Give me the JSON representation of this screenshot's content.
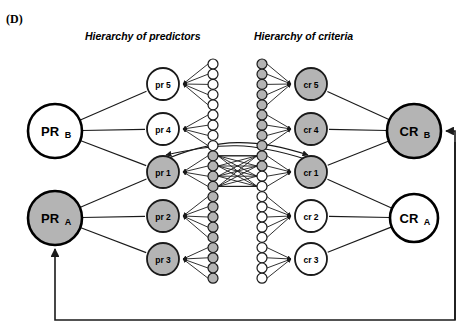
{
  "figure": {
    "panel_label": "(D)",
    "width": 471,
    "height": 336,
    "background": "#ffffff"
  },
  "colors": {
    "shaded": "#b4b4b4",
    "unshaded": "#ffffff",
    "stroke": "#1a1a1a",
    "text": "#000000"
  },
  "titles": {
    "predictors": "Hierarchy of predictors",
    "criteria": "Hierarchy of criteria"
  },
  "nodes": {
    "constructs": [
      {
        "id": "PR_B",
        "main": "PR",
        "sub": "B",
        "shaded": false,
        "cx": 55,
        "cy": 131,
        "r": 27
      },
      {
        "id": "PR_A",
        "main": "PR",
        "sub": "A",
        "shaded": true,
        "cx": 55,
        "cy": 218,
        "r": 27
      },
      {
        "id": "CR_B",
        "main": "CR",
        "sub": "B",
        "shaded": true,
        "cx": 414,
        "cy": 131,
        "r": 27
      },
      {
        "id": "CR_A",
        "main": "CR",
        "sub": "A",
        "shaded": false,
        "cx": 414,
        "cy": 218,
        "r": 24
      }
    ],
    "predictor_facets": [
      {
        "id": "pr5",
        "label": "pr 5",
        "shaded": false,
        "cx": 163,
        "cy": 84,
        "r": 16
      },
      {
        "id": "pr4",
        "label": "pr 4",
        "shaded": false,
        "cx": 163,
        "cy": 129,
        "r": 16
      },
      {
        "id": "pr1",
        "label": "pr 1",
        "shaded": true,
        "cx": 163,
        "cy": 172,
        "r": 16
      },
      {
        "id": "pr2",
        "label": "pr 2",
        "shaded": true,
        "cx": 163,
        "cy": 216,
        "r": 16
      },
      {
        "id": "pr3",
        "label": "pr 3",
        "shaded": true,
        "cx": 163,
        "cy": 259,
        "r": 16
      }
    ],
    "criteria_facets": [
      {
        "id": "cr5",
        "label": "cr 5",
        "shaded": true,
        "cx": 311,
        "cy": 84,
        "r": 16
      },
      {
        "id": "cr4",
        "label": "cr 4",
        "shaded": true,
        "cx": 311,
        "cy": 129,
        "r": 16
      },
      {
        "id": "cr1",
        "label": "cr 1",
        "shaded": true,
        "cx": 311,
        "cy": 172,
        "r": 16
      },
      {
        "id": "cr2",
        "label": "cr 2",
        "shaded": false,
        "cx": 311,
        "cy": 216,
        "r": 16
      },
      {
        "id": "cr3",
        "label": "cr 3",
        "shaded": false,
        "cx": 311,
        "cy": 259,
        "r": 16
      }
    ],
    "predictor_items": {
      "cx": 213,
      "top": 64,
      "count": 22,
      "spacing": 10.2,
      "r": 5.0,
      "shaded_from_index": 9
    },
    "criteria_items": {
      "cx": 262,
      "top": 64,
      "count": 22,
      "spacing": 10.2,
      "r": 5.0,
      "shaded_until_index": 11
    }
  },
  "feedback_loops": [
    {
      "id": "criteria-to-predictor-feedback",
      "from": "CR_A-region",
      "to": "PR_A",
      "description": "bottom loop returning to PR A"
    },
    {
      "id": "predictor-to-criteria-feedback",
      "from": "bottom-right",
      "to": "CR_B",
      "description": "right loop returning to CR B"
    }
  ],
  "cross_links": [
    {
      "from": "pr1",
      "to": "cr1",
      "style": "curved-arrow"
    },
    {
      "from": "cr1",
      "to": "pr1",
      "style": "curved-arrow"
    }
  ]
}
